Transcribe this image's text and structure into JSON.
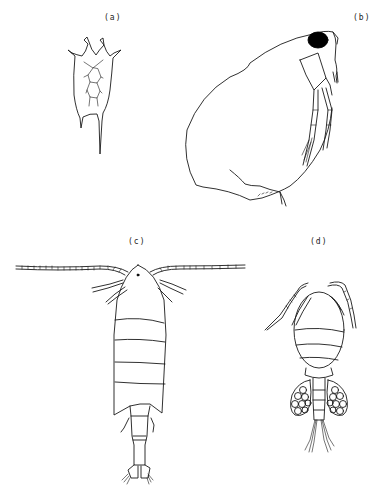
{
  "figure": {
    "panels": [
      {
        "id": "a",
        "label": "(a)",
        "subject": "rotifer (Keratella-like, loricate with anterior spines)"
      },
      {
        "id": "b",
        "label": "(b)",
        "subject": "cladoceran (Daphnia-like, lateral view with dark compound eye)"
      },
      {
        "id": "c",
        "label": "(c)",
        "subject": "calanoid copepod (dorsal view, long antennules)"
      },
      {
        "id": "d",
        "label": "(d)",
        "subject": "cyclopoid copepod (dorsal view, paired egg sacs)"
      }
    ],
    "colors": {
      "line": "#1a1a1a",
      "background": "#ffffff",
      "eye": "#000000"
    }
  }
}
